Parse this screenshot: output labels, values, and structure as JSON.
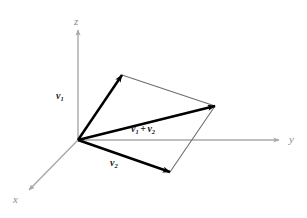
{
  "figure": {
    "background_color": "#ffffff",
    "axis_color": "#a8a8a8",
    "vector_color": "#000000",
    "thin_line_color": "#6e6e6e",
    "label_color_axis": "#8d8d8d",
    "label_color_vector": "#1a1a1a"
  },
  "axes": {
    "origin": {
      "x": 78,
      "y": 140
    },
    "items": [
      {
        "name": "z",
        "label": "z",
        "label_x": 74,
        "label_y": 16,
        "tip_x": 78,
        "tip_y": 28,
        "start_x": 78,
        "start_y": 140
      },
      {
        "name": "y",
        "label": "y",
        "label_x": 289,
        "label_y": 134,
        "tip_x": 281,
        "tip_y": 140,
        "start_x": 78,
        "start_y": 140
      },
      {
        "name": "x",
        "label": "x",
        "label_x": 13,
        "label_y": 194,
        "tip_x": 28,
        "tip_y": 191,
        "start_x": 78,
        "start_y": 140
      }
    ]
  },
  "vectors": [
    {
      "name": "v1",
      "label_html": "<b>v</b><sub>1</sub>",
      "label_x": 56,
      "label_y": 91,
      "from_x": 78,
      "from_y": 140,
      "to_x": 122,
      "to_y": 75
    },
    {
      "name": "v2",
      "label_html": "<b>v</b><sub>2</sub>",
      "label_x": 110,
      "label_y": 158,
      "from_x": 78,
      "from_y": 140,
      "to_x": 170,
      "to_y": 172
    },
    {
      "name": "v1-plus-v2",
      "label_html": "<b>v</b><sub>1</sub><span class=\"plus\">+</span><b>v</b><sub>2</sub>",
      "label_x": 131,
      "label_y": 124,
      "from_x": 78,
      "from_y": 140,
      "to_x": 215,
      "to_y": 106
    }
  ],
  "parallelogram": {
    "name": "parallelogram-completion",
    "edges": [
      {
        "name": "edge-v1-to-sum",
        "x1": 122,
        "y1": 75,
        "x2": 215,
        "y2": 106
      },
      {
        "name": "edge-v2-to-sum",
        "x1": 170,
        "y1": 172,
        "x2": 215,
        "y2": 106
      }
    ]
  },
  "chart_data": {
    "type": "scatter",
    "xlabel": "x",
    "ylabel": "y",
    "zlabel": "z",
    "grid": false,
    "legend": "none",
    "annotations": [
      "v1",
      "v2",
      "v1 + v2",
      "x",
      "y",
      "z"
    ],
    "series": [
      {
        "name": "v1",
        "from": [
          0,
          0,
          0
        ],
        "to_pixels": [
          122,
          75
        ]
      },
      {
        "name": "v2",
        "from": [
          0,
          0,
          0
        ],
        "to_pixels": [
          170,
          172
        ]
      },
      {
        "name": "v1 + v2",
        "from": [
          0,
          0,
          0
        ],
        "to_pixels": [
          215,
          106
        ]
      }
    ]
  }
}
